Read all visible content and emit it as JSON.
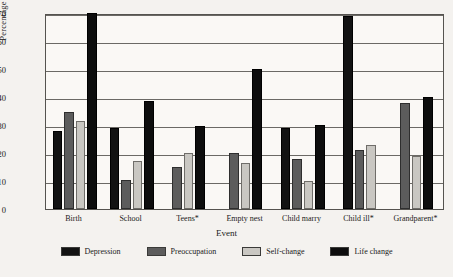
{
  "chart_data": {
    "type": "bar",
    "title": "",
    "xlabel": "Event",
    "ylabel": "Percentage Who React",
    "ylim": [
      0,
      70
    ],
    "yticks": [
      0,
      10,
      20,
      30,
      40,
      50,
      60,
      70
    ],
    "grid": true,
    "legend_position": "bottom",
    "categories": [
      "Birth",
      "School",
      "Teens*",
      "Empty nest",
      "Child marry",
      "Child ill*",
      "Grandparent*"
    ],
    "series": [
      {
        "name": "Depression",
        "color": "#121212",
        "values": [
          28,
          29,
          null,
          null,
          29,
          69,
          null
        ]
      },
      {
        "name": "Preoccupation",
        "color": "#5c5c5c",
        "values": [
          34.5,
          10.5,
          15,
          20,
          18,
          21,
          38
        ]
      },
      {
        "name": "Self-change",
        "color": "#c9c7c2",
        "values": [
          31.5,
          17,
          20,
          16.5,
          10,
          23,
          19
        ]
      },
      {
        "name": "Life change",
        "color": "#0d0d0d",
        "values": [
          70,
          38.5,
          29.5,
          50,
          30,
          null,
          40
        ]
      }
    ]
  },
  "legend": {
    "items": [
      {
        "label": "Depression",
        "swatch": "#121212"
      },
      {
        "label": "Preoccupation",
        "swatch": "#5c5c5c"
      },
      {
        "label": "Self-change",
        "swatch": "#c9c7c2"
      },
      {
        "label": "Life change",
        "swatch": "#0d0d0d"
      }
    ]
  }
}
